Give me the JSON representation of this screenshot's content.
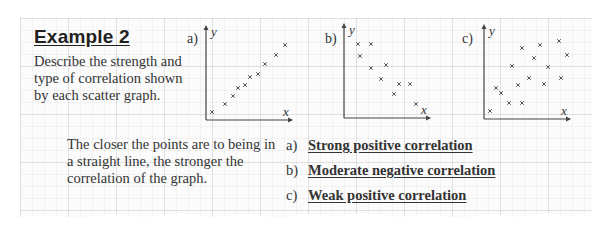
{
  "example": {
    "title": "Example 2",
    "description": "Describe the strength and type of correlation shown by each scatter graph."
  },
  "note": "The closer the points are to being in a straight line, the stronger the correlation of the graph.",
  "answers": [
    {
      "letter": "a)",
      "text": "Strong positive correlation"
    },
    {
      "letter": "b)",
      "text": "Moderate negative correlation"
    },
    {
      "letter": "c)",
      "text": "Weak positive correlation"
    }
  ],
  "colors": {
    "text": "#333333",
    "axis": "#444444",
    "marker": "#555555",
    "grid": "#e6e6e6"
  },
  "chart_data": [
    {
      "type": "scatter",
      "label": "a)",
      "xlabel": "x",
      "ylabel": "y",
      "grid": true,
      "points": [
        [
          6,
          8
        ],
        [
          19,
          16
        ],
        [
          27,
          24
        ],
        [
          32,
          32
        ],
        [
          39,
          35
        ],
        [
          44,
          43
        ],
        [
          52,
          46
        ],
        [
          59,
          56
        ],
        [
          70,
          65
        ],
        [
          79,
          75
        ]
      ]
    },
    {
      "type": "scatter",
      "label": "b)",
      "xlabel": "x",
      "ylabel": "y",
      "grid": true,
      "points": [
        [
          14,
          74
        ],
        [
          27,
          74
        ],
        [
          16,
          62
        ],
        [
          27,
          50
        ],
        [
          42,
          53
        ],
        [
          37,
          39
        ],
        [
          55,
          34
        ],
        [
          66,
          34
        ],
        [
          50,
          24
        ],
        [
          72,
          14
        ]
      ]
    },
    {
      "type": "scatter",
      "label": "c)",
      "xlabel": "x",
      "ylabel": "y",
      "grid": true,
      "points": [
        [
          6,
          8
        ],
        [
          12,
          31
        ],
        [
          17,
          26
        ],
        [
          25,
          16
        ],
        [
          28,
          53
        ],
        [
          34,
          34
        ],
        [
          38,
          71
        ],
        [
          38,
          16
        ],
        [
          45,
          41
        ],
        [
          50,
          61
        ],
        [
          56,
          74
        ],
        [
          60,
          35
        ],
        [
          64,
          52
        ],
        [
          75,
          78
        ],
        [
          77,
          41
        ],
        [
          83,
          64
        ]
      ]
    }
  ]
}
